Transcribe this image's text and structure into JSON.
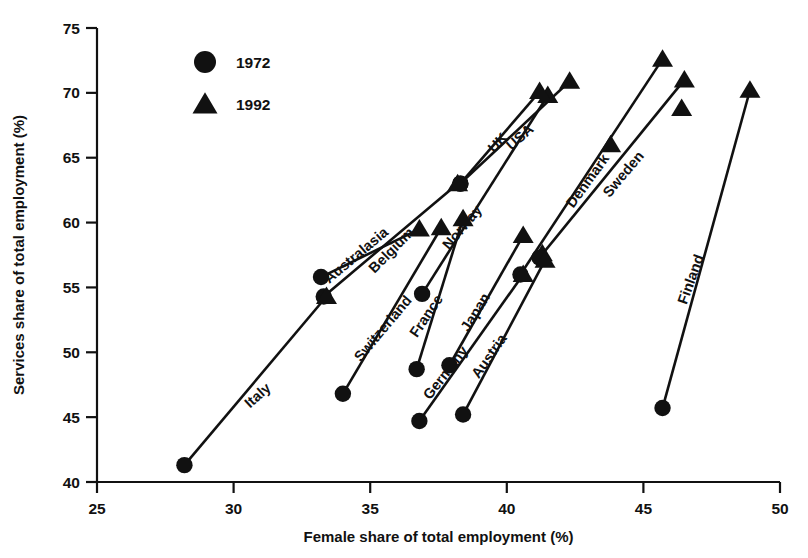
{
  "chart_data": {
    "type": "scatter",
    "title": "",
    "xlabel": "Female share of total employment (%)",
    "ylabel": "Services share of total employment (%)",
    "xlim": [
      25,
      50
    ],
    "ylim": [
      40,
      75
    ],
    "xticks": [
      25,
      30,
      35,
      40,
      45,
      50
    ],
    "yticks": [
      40,
      45,
      50,
      55,
      60,
      65,
      70,
      75
    ],
    "grid": false,
    "legend_position": "top-left-inside",
    "legend": [
      {
        "label": "1972",
        "marker": "circle"
      },
      {
        "label": "1992",
        "marker": "triangle"
      }
    ],
    "series": [
      {
        "name": "1972",
        "marker": "circle"
      },
      {
        "name": "1992",
        "marker": "triangle"
      }
    ],
    "annotations": [
      "Italy",
      "Switzerland",
      "Australasia",
      "Belgium",
      "France",
      "Germany",
      "Norway",
      "Japan",
      "Austria",
      "UK",
      "USA",
      "Denmark",
      "Sweden",
      "Finland"
    ],
    "points": [
      {
        "country": "Italy",
        "x1972": 28.2,
        "y1972": 41.3,
        "x1992": 33.4,
        "y1992": 54.3,
        "label_x": 31.0,
        "label_y": 46.4,
        "label_angle": -42
      },
      {
        "country": "Switzerland",
        "x1972": 34.0,
        "y1972": 46.8,
        "x1992": 37.6,
        "y1992": 59.6,
        "label_x": 35.6,
        "label_y": 51.6,
        "label_angle": -50
      },
      {
        "country": "Australasia",
        "x1972": 33.2,
        "y1972": 55.8,
        "x1992": 36.8,
        "y1992": 59.5,
        "label_x": 34.6,
        "label_y": 57.2,
        "label_angle": -40
      },
      {
        "country": "Belgium",
        "x1972": 33.3,
        "y1972": 54.3,
        "x1992": 38.2,
        "y1992": 63.0,
        "label_x": 35.9,
        "label_y": 57.6,
        "label_angle": -45
      },
      {
        "country": "France",
        "x1972": 36.7,
        "y1972": 48.7,
        "x1992": 38.4,
        "y1992": 60.3,
        "label_x": 37.2,
        "label_y": 52.6,
        "label_angle": -56
      },
      {
        "country": "Germany",
        "x1972": 36.8,
        "y1972": 44.7,
        "x1992": 40.6,
        "y1992": 56.0,
        "label_x": 37.9,
        "label_y": 48.2,
        "label_angle": -52
      },
      {
        "country": "Norway",
        "x1972": 36.9,
        "y1972": 54.5,
        "x1992": 41.5,
        "y1992": 69.8,
        "label_x": 38.5,
        "label_y": 59.4,
        "label_angle": -50
      },
      {
        "country": "Japan",
        "x1972": 37.9,
        "y1972": 49.0,
        "x1992": 40.6,
        "y1992": 59.0,
        "label_x": 39.0,
        "label_y": 52.9,
        "label_angle": -58
      },
      {
        "country": "Austria",
        "x1972": 38.4,
        "y1972": 45.2,
        "x1992": 41.4,
        "y1992": 57.1,
        "label_x": 39.5,
        "label_y": 49.5,
        "label_angle": -55
      },
      {
        "country": "UK",
        "x1972": 38.3,
        "y1972": 63.0,
        "x1992": 41.2,
        "y1992": 70.1,
        "label_x": 39.8,
        "label_y": 65.9,
        "label_angle": -46
      },
      {
        "country": "USA",
        "x1972": 38.3,
        "y1972": 63.0,
        "x1992": 42.3,
        "y1992": 70.9,
        "label_x": 40.6,
        "label_y": 66.3,
        "label_angle": -42
      },
      {
        "country": "Denmark",
        "x1972": 40.5,
        "y1972": 56.0,
        "x1992": 45.7,
        "y1992": 72.6,
        "label_x": 43.1,
        "label_y": 63.0,
        "label_angle": -54
      },
      {
        "country": "Sweden",
        "x1972": 41.2,
        "y1972": 57.3,
        "x1992": 46.5,
        "y1992": 71.0,
        "label_x": 44.4,
        "label_y": 63.5,
        "label_angle": -50
      },
      {
        "country": "Finland",
        "x1972": 45.7,
        "y1972": 45.7,
        "x1992": 48.9,
        "y1992": 70.2,
        "label_x": 46.9,
        "label_y": 55.5,
        "label_angle": -70
      }
    ],
    "extra_points_1992": [
      {
        "x": 41.3,
        "y": 57.6
      },
      {
        "x": 46.4,
        "y": 68.8
      },
      {
        "x": 43.8,
        "y": 66.0
      }
    ]
  },
  "legend": {
    "item_1972": "1972",
    "item_1992": "1992"
  },
  "axes": {
    "xlabel": "Female share of total employment (%)",
    "ylabel": "Services share of total employment (%)",
    "xticks": [
      "25",
      "30",
      "35",
      "40",
      "45",
      "50"
    ],
    "yticks": [
      "40",
      "45",
      "50",
      "55",
      "60",
      "65",
      "70",
      "75"
    ]
  },
  "colors": {
    "ink": "#111111",
    "background": "#ffffff"
  }
}
